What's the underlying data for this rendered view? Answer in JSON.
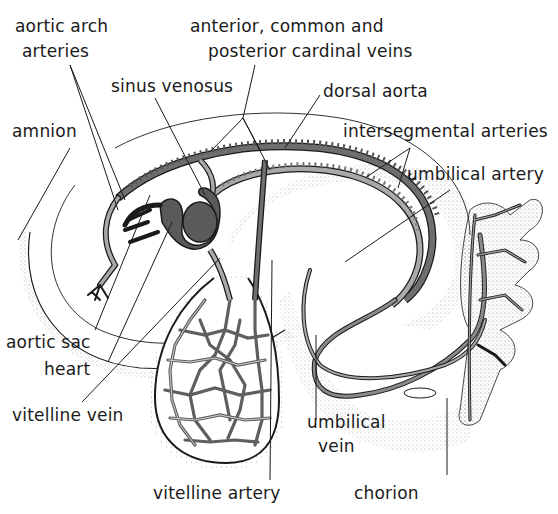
{
  "figure": {
    "type": "anatomical-diagram",
    "colors": {
      "background": "#ffffff",
      "vessel_fill": "#6e6e6e",
      "vessel_light": "#a9a9a9",
      "outline": "#1a1a1a",
      "stipple": "#8a8a8a",
      "heart": "#5a5a5a"
    }
  },
  "labels": {
    "aortic_arch_arteries": [
      "aortic arch",
      "arteries"
    ],
    "cardinal_veins": [
      "anterior, common and",
      "posterior cardinal veins"
    ],
    "sinus_venosus": "sinus venosus",
    "dorsal_aorta": "dorsal aorta",
    "amnion": "amnion",
    "intersegmental_arteries": "intersegmental arteries",
    "umbilical_artery": "umbilical artery",
    "aortic_sac": "aortic sac",
    "heart": "heart",
    "vitelline_vein": "vitelline vein",
    "umbilical_vein": [
      "umbilical",
      "vein"
    ],
    "vitelline_artery": "vitelline artery",
    "chorion": "chorion"
  }
}
